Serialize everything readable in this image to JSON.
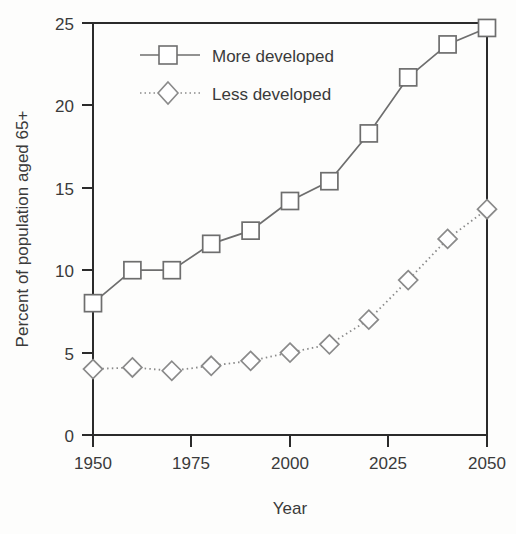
{
  "chart_data": {
    "type": "line",
    "title": "",
    "subtitle": "",
    "xlabel": "Year",
    "ylabel": "Percent of population aged 65+",
    "x": [
      1950,
      1960,
      1970,
      1980,
      1990,
      2000,
      2010,
      2020,
      2030,
      2040,
      2050
    ],
    "xlim": [
      1950,
      2050
    ],
    "ylim": [
      0,
      25
    ],
    "xticks": [
      1950,
      1975,
      2000,
      2025,
      2050
    ],
    "xtick_labels": [
      "1950",
      "1975",
      "2000",
      "2025",
      "2050"
    ],
    "yticks": [
      0,
      5,
      10,
      15,
      20,
      25
    ],
    "ytick_labels": [
      "0",
      "5",
      "10",
      "15",
      "20",
      "25"
    ],
    "grid": false,
    "legend_position": "top-left-inside",
    "series": [
      {
        "name": "More developed",
        "marker": "square",
        "line_style": "solid",
        "color": "#6e6e6e",
        "values": [
          8.0,
          10.0,
          10.0,
          11.6,
          12.4,
          14.2,
          15.4,
          18.3,
          21.7,
          23.7,
          24.7
        ]
      },
      {
        "name": "Less developed",
        "marker": "diamond",
        "line_style": "dotted",
        "color": "#8a8a8a",
        "values": [
          4.0,
          4.1,
          3.9,
          4.2,
          4.5,
          5.0,
          5.5,
          7.0,
          9.4,
          11.9,
          13.7
        ]
      }
    ]
  },
  "axes": {
    "x_title": "Year",
    "y_title": "Percent of population aged 65+"
  },
  "legend": {
    "entries": [
      {
        "label": "More developed",
        "marker": "square-marker-icon",
        "line": "solid-line-icon"
      },
      {
        "label": "Less developed",
        "marker": "diamond-marker-icon",
        "line": "dotted-line-icon"
      }
    ]
  },
  "colors": {
    "axis": "#2b2b2b",
    "series_more_developed": "#6e6e6e",
    "series_less_developed": "#8a8a8a",
    "text": "#3a3a3a",
    "background": "#fdfdfc"
  }
}
